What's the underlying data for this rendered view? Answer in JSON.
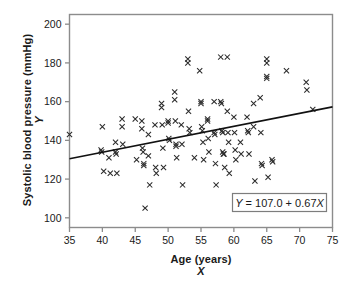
{
  "figure": {
    "background_color": "#ffffff",
    "frame_color": "#8c8c8c",
    "marker_color": "#2b2b2b",
    "line_color": "#111111"
  },
  "axes": {
    "y": {
      "title": "Systolic blood pressure (mmHg)",
      "variable": "Y",
      "ticks": [
        100,
        120,
        140,
        160,
        180,
        200
      ],
      "min": 95,
      "max": 205
    },
    "x": {
      "title": "Age (years)",
      "variable": "X",
      "ticks": [
        35,
        40,
        45,
        50,
        55,
        60,
        65,
        70,
        75
      ],
      "min": 35,
      "max": 75
    }
  },
  "annotation": {
    "equation": "Y = 107.0 + 0.67X",
    "equation_parts": {
      "lhs": "Y",
      "operator_eq": "=",
      "intercept": "107.0",
      "operator_plus": "+",
      "slope": "0.67",
      "rhs_var": "X"
    }
  },
  "chart_data": {
    "type": "scatter",
    "title": "",
    "xlabel": "Age (years)",
    "ylabel": "Systolic blood pressure (mmHg)",
    "xlim": [
      35,
      75
    ],
    "ylim": [
      95,
      205
    ],
    "grid": false,
    "legend": null,
    "marker": "x",
    "regression_line": {
      "label": "Y = 107.0 + 0.67X",
      "intercept": 107.0,
      "slope": 0.67,
      "x_start": 35,
      "x_end": 75,
      "y_start": 130.5,
      "y_end": 157.3
    },
    "points": [
      [
        35.0,
        143
      ],
      [
        39.8,
        135
      ],
      [
        39.9,
        134
      ],
      [
        40.0,
        147
      ],
      [
        40.2,
        124
      ],
      [
        41.0,
        131
      ],
      [
        41.2,
        123
      ],
      [
        42.0,
        139
      ],
      [
        42.0,
        134
      ],
      [
        42.1,
        133
      ],
      [
        42.2,
        123
      ],
      [
        43.0,
        151
      ],
      [
        43.0,
        147
      ],
      [
        43.1,
        138
      ],
      [
        45.0,
        151
      ],
      [
        45.2,
        130
      ],
      [
        46.0,
        150
      ],
      [
        46.0,
        146
      ],
      [
        46.1,
        136
      ],
      [
        46.2,
        134
      ],
      [
        46.3,
        128
      ],
      [
        46.3,
        127
      ],
      [
        46.5,
        105
      ],
      [
        47.0,
        143
      ],
      [
        47.0,
        132
      ],
      [
        47.2,
        117
      ],
      [
        48.0,
        148
      ],
      [
        48.1,
        126
      ],
      [
        48.2,
        123
      ],
      [
        49.0,
        159
      ],
      [
        49.0,
        157
      ],
      [
        49.1,
        148
      ],
      [
        49.2,
        136
      ],
      [
        49.3,
        126
      ],
      [
        50.0,
        150
      ],
      [
        50.0,
        149
      ],
      [
        50.1,
        141
      ],
      [
        50.2,
        140
      ],
      [
        51.0,
        165
      ],
      [
        51.0,
        161
      ],
      [
        51.1,
        150
      ],
      [
        51.2,
        138
      ],
      [
        51.2,
        137
      ],
      [
        51.3,
        131
      ],
      [
        52.0,
        148
      ],
      [
        52.1,
        138
      ],
      [
        52.2,
        117
      ],
      [
        53.0,
        182
      ],
      [
        53.0,
        180
      ],
      [
        53.1,
        155
      ],
      [
        53.2,
        146
      ],
      [
        53.3,
        144
      ],
      [
        54.0,
        131
      ],
      [
        54.8,
        176
      ],
      [
        55.0,
        160
      ],
      [
        55.0,
        159
      ],
      [
        55.1,
        147
      ],
      [
        55.2,
        145
      ],
      [
        55.3,
        139
      ],
      [
        55.4,
        130
      ],
      [
        56.0,
        151
      ],
      [
        56.0,
        150
      ],
      [
        56.1,
        141
      ],
      [
        56.2,
        134
      ],
      [
        57.0,
        160
      ],
      [
        57.0,
        144
      ],
      [
        57.1,
        143
      ],
      [
        57.2,
        128
      ],
      [
        57.3,
        117
      ],
      [
        58.0,
        183
      ],
      [
        58.0,
        160
      ],
      [
        58.1,
        159
      ],
      [
        58.2,
        145
      ],
      [
        58.3,
        144
      ],
      [
        58.3,
        134
      ],
      [
        58.4,
        133
      ],
      [
        58.5,
        133
      ],
      [
        58.6,
        126
      ],
      [
        59.0,
        183
      ],
      [
        59.0,
        155
      ],
      [
        59.1,
        144
      ],
      [
        59.2,
        139
      ],
      [
        59.3,
        123
      ],
      [
        60.0,
        152
      ],
      [
        60.1,
        144
      ],
      [
        60.2,
        135
      ],
      [
        60.3,
        130
      ],
      [
        61.0,
        139
      ],
      [
        61.1,
        133
      ],
      [
        62.0,
        152
      ],
      [
        62.1,
        145
      ],
      [
        62.2,
        144
      ],
      [
        62.3,
        133
      ],
      [
        63.0,
        159
      ],
      [
        63.0,
        147
      ],
      [
        63.2,
        119
      ],
      [
        64.0,
        162
      ],
      [
        64.1,
        144
      ],
      [
        64.2,
        128
      ],
      [
        64.3,
        127
      ],
      [
        65.0,
        182
      ],
      [
        65.0,
        180
      ],
      [
        65.0,
        173
      ],
      [
        65.0,
        172
      ],
      [
        65.2,
        121
      ],
      [
        65.8,
        130
      ],
      [
        65.9,
        129
      ],
      [
        68.0,
        176
      ],
      [
        71.0,
        170
      ],
      [
        71.1,
        166
      ],
      [
        72.0,
        156
      ]
    ]
  }
}
